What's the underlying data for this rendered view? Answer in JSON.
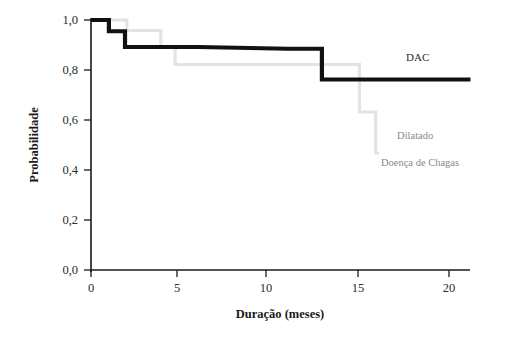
{
  "chart_data": {
    "type": "line",
    "subtype": "kaplan-meier-step",
    "title": "",
    "xlabel": "Duração (meses)",
    "ylabel": "Probabilidade",
    "xlim": [
      0,
      21.5
    ],
    "ylim": [
      0.0,
      1.0
    ],
    "grid": false,
    "legend_position": "inline-right",
    "xticks": [
      0,
      5,
      10,
      15,
      20
    ],
    "xtick_labels": [
      "0",
      "5",
      "10",
      "15",
      "20"
    ],
    "yticks": [
      0.0,
      0.2,
      0.4,
      0.6,
      0.8,
      1.0
    ],
    "ytick_labels": [
      "0,0",
      "0,2",
      "0,4",
      "0,6",
      "0,8",
      "1,0"
    ],
    "series": [
      {
        "name": "DAC",
        "color": "#111111",
        "style": "thick-black-step",
        "label_x": 17.6,
        "label_y": 0.835,
        "points": [
          {
            "x": 0.0,
            "y": 1.0
          },
          {
            "x": 1.0,
            "y": 1.0
          },
          {
            "x": 1.0,
            "y": 0.955
          },
          {
            "x": 1.9,
            "y": 0.955
          },
          {
            "x": 1.9,
            "y": 0.892
          },
          {
            "x": 2.6,
            "y": 0.892
          },
          {
            "x": 3.3,
            "y": 0.892
          },
          {
            "x": 6.0,
            "y": 0.892
          },
          {
            "x": 11.0,
            "y": 0.885
          },
          {
            "x": 12.9,
            "y": 0.885
          },
          {
            "x": 12.9,
            "y": 0.762
          },
          {
            "x": 21.2,
            "y": 0.762
          }
        ]
      },
      {
        "name": "Dilatado",
        "color": "#e3e3e3",
        "style": "thin-gray-step",
        "label_x": 17.1,
        "label_y": 0.525,
        "points": [
          {
            "x": 0.0,
            "y": 1.0
          },
          {
            "x": 2.0,
            "y": 1.0
          },
          {
            "x": 2.0,
            "y": 0.958
          },
          {
            "x": 3.9,
            "y": 0.958
          },
          {
            "x": 3.9,
            "y": 0.893
          },
          {
            "x": 4.7,
            "y": 0.893
          },
          {
            "x": 4.7,
            "y": 0.822
          },
          {
            "x": 15.0,
            "y": 0.822
          },
          {
            "x": 15.0,
            "y": 0.632
          },
          {
            "x": 15.9,
            "y": 0.632
          },
          {
            "x": 15.9,
            "y": 0.468
          },
          {
            "x": 16.1,
            "y": 0.468
          }
        ]
      },
      {
        "name": "Doença de Chagas",
        "color": "#8a8a8a",
        "style": "label-only",
        "label_x": 16.2,
        "label_y": 0.418,
        "points": []
      }
    ]
  },
  "axes": {
    "y_title": "Probabilidade",
    "x_title": "Duração (meses)"
  },
  "legend": {
    "entries": [
      {
        "label": "DAC"
      },
      {
        "label": "Dilatado"
      },
      {
        "label": "Doença de Chagas"
      }
    ]
  }
}
